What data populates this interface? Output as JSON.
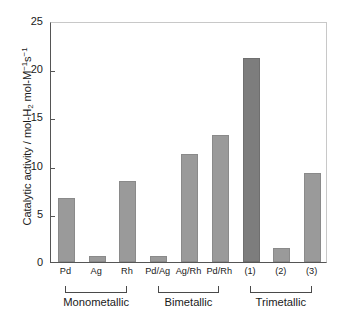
{
  "chart_data": {
    "type": "bar",
    "title": "",
    "subtitle": "",
    "xlabel": "",
    "ylabel": "Catalytic activity / mol-H2 mol-M-1s-1",
    "ylabel_parts": {
      "lead": "Catalytic activity / mol-H",
      "sub1": "2",
      "mid": " mol-M",
      "sup1": "−1",
      "mid2": "s",
      "sup2": "−1"
    },
    "categories": [
      "Pd",
      "Ag",
      "Rh",
      "Pd/Ag",
      "Ag/Rh",
      "Pd/Rh",
      "(1)",
      "(2)",
      "(3)"
    ],
    "values": [
      6.6,
      0.6,
      8.4,
      0.6,
      11.2,
      13.2,
      21.2,
      1.5,
      9.2
    ],
    "ylim": [
      0,
      25
    ],
    "yticks": [
      0,
      5,
      10,
      15,
      20,
      25
    ],
    "ytick_labels": [
      "0",
      "5",
      "10",
      "15",
      "20",
      "25"
    ],
    "grid": false,
    "legend": "none",
    "bar_color": "#9a9a9a",
    "highlight_color": "#7d7d7d",
    "highlight_index": 6,
    "axis_color": "#555555",
    "groups": [
      {
        "label": "Monometallic",
        "start_index": 0,
        "end_index": 2
      },
      {
        "label": "Bimetallic",
        "start_index": 3,
        "end_index": 5
      },
      {
        "label": "Trimetallic",
        "start_index": 6,
        "end_index": 8
      }
    ]
  }
}
